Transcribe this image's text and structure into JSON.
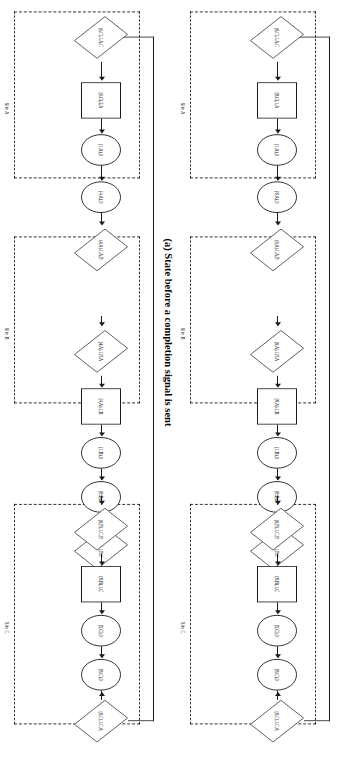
{
  "figure": {
    "caption": "(a) State before a completion signal is sent",
    "site_labels": {
      "a": "Site A",
      "b": "Site B",
      "c": "Site C"
    },
    "diagrams": [
      {
        "id": "top",
        "nodes": [
          {
            "key": "a_rect",
            "shape": "rect",
            "label": "(8,C),1,A"
          },
          {
            "key": "a_c1",
            "shape": "circle",
            "label": "(1,A),0"
          },
          {
            "key": "a_c2",
            "shape": "circle",
            "label": "(8,A),0"
          },
          {
            "key": "a_d_exit",
            "shape": "diamond",
            "label": "(8,A),1,A,B"
          },
          {
            "key": "b_d_enter",
            "shape": "diamond",
            "label": "(8,A),1,B,A"
          },
          {
            "key": "b_rect",
            "shape": "rect",
            "label": "(8,A),1,B"
          },
          {
            "key": "b_c1",
            "shape": "circle",
            "label": "(1,B),0"
          },
          {
            "key": "b_c2",
            "shape": "circle",
            "label": "(8,B),0"
          },
          {
            "key": "b_d_exit",
            "shape": "diamond",
            "label": "(8,B),1,B,C"
          },
          {
            "key": "c_d_enter",
            "shape": "diamond",
            "label": "(8,B),1,C,B"
          },
          {
            "key": "c_rect",
            "shape": "rect",
            "label": "(8,B),1,C"
          },
          {
            "key": "c_c1",
            "shape": "circle",
            "label": "(5,C),0"
          },
          {
            "key": "c_c2",
            "shape": "circle",
            "label": "(8,C),0"
          },
          {
            "key": "c_d_exit",
            "shape": "diamond",
            "label": "(8,C),1,C,A"
          },
          {
            "key": "a_d_in",
            "shape": "diamond",
            "label": "(8,C),1,A,C"
          }
        ]
      },
      {
        "id": "bottom",
        "nodes": [
          {
            "key": "a_rect",
            "shape": "rect",
            "label": "(6,C),2,A"
          },
          {
            "key": "a_c1",
            "shape": "circle",
            "label": "(1,A),0"
          },
          {
            "key": "a_c2",
            "shape": "circle",
            "label": "(4,A),0"
          },
          {
            "key": "a_d_exit",
            "shape": "diamond",
            "label": "(4,A),1,A,B"
          },
          {
            "key": "b_d_enter",
            "shape": "diamond",
            "label": "(4,A),1,B,A"
          },
          {
            "key": "b_rect",
            "shape": "rect",
            "label": "(4,A),1,B"
          },
          {
            "key": "b_c1",
            "shape": "circle",
            "label": "(1,B),0"
          },
          {
            "key": "b_c2",
            "shape": "circle",
            "label": "(8,B),0"
          },
          {
            "key": "b_d_exit",
            "shape": "diamond",
            "label": "(8,B),1,B,C"
          },
          {
            "key": "c_d_enter",
            "shape": "diamond",
            "label": "(8,B),1,C,B"
          },
          {
            "key": "c_rect",
            "shape": "rect",
            "label": "(8,B),1,C"
          },
          {
            "key": "c_c1",
            "shape": "circle",
            "label": "(5,C),0"
          },
          {
            "key": "c_c2",
            "shape": "circle",
            "label": "(8,C),0"
          },
          {
            "key": "c_d_exit",
            "shape": "diamond",
            "label": "(8,C),1,C,A"
          },
          {
            "key": "a_d_in",
            "shape": "diamond",
            "label": "(6,C),1,A,C"
          }
        ]
      }
    ]
  }
}
